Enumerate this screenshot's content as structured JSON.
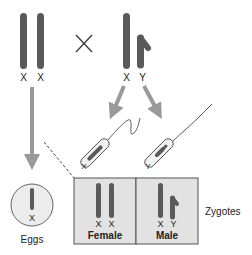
{
  "diagram": {
    "mother": {
      "chromosomes": [
        "X",
        "X"
      ]
    },
    "cross_symbol": "×",
    "father": {
      "chromosomes": [
        "X",
        "Y"
      ]
    },
    "gametes": {
      "egg": {
        "chromosome": "X",
        "label": "Eggs"
      },
      "sperm": [
        {
          "chromosome": "X"
        },
        {
          "chromosome": "Y"
        }
      ]
    },
    "zygotes": {
      "label": "Zygotes",
      "female": {
        "chromosomes": [
          "X",
          "X"
        ],
        "label": "Female"
      },
      "male": {
        "chromosomes": [
          "X",
          "Y"
        ],
        "label": "Male"
      }
    },
    "colors": {
      "chromosome": "#5a5a5a",
      "arrow": "#9a9a9a",
      "zygote_box": "#e2e2e2",
      "egg_fill": "#ececec"
    }
  }
}
